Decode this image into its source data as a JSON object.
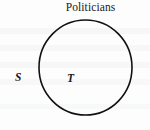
{
  "figure": {
    "type": "venn-diagram",
    "title": "Politicians",
    "background_color": "#fdfdfd",
    "stroke_color": "#111111",
    "labels": {
      "universe_label": "S",
      "subset_label": "T"
    },
    "shapes": [
      {
        "name": "subset-circle",
        "shape": "circle",
        "center_x": 85.5,
        "center_y": 67.5,
        "radius_x": 46.5,
        "radius_y": 47.5,
        "stroke_width": 1.6,
        "fill": "none"
      }
    ]
  }
}
